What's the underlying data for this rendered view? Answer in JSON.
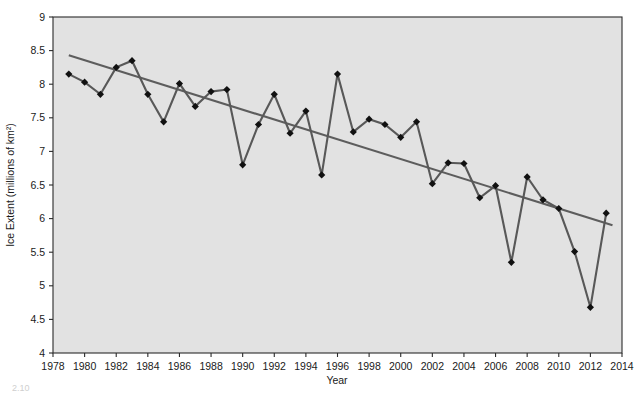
{
  "chart_data": {
    "type": "line",
    "title": "",
    "xlabel": "Year",
    "ylabel": "Ice Extent (millions of km2)",
    "ylabel_display": "Ice Extent (millions of km²)",
    "xlim": [
      1978,
      2014
    ],
    "ylim": [
      4,
      9
    ],
    "xticks": [
      1978,
      1980,
      1982,
      1984,
      1986,
      1988,
      1990,
      1992,
      1994,
      1996,
      1998,
      2000,
      2002,
      2004,
      2006,
      2008,
      2010,
      2012,
      2014
    ],
    "yticks": [
      4,
      4.5,
      5,
      5.5,
      6,
      6.5,
      7,
      7.5,
      8,
      8.5,
      9
    ],
    "grid": false,
    "legend": "none",
    "x": [
      1979,
      1980,
      1981,
      1982,
      1983,
      1984,
      1985,
      1986,
      1987,
      1988,
      1989,
      1990,
      1991,
      1992,
      1993,
      1994,
      1995,
      1996,
      1997,
      1998,
      1999,
      2000,
      2001,
      2002,
      2003,
      2004,
      2005,
      2006,
      2007,
      2008,
      2009,
      2010,
      2011,
      2012,
      2013
    ],
    "series": [
      {
        "name": "Arctic sea ice extent",
        "marker": "diamond",
        "color": "#585858",
        "values": [
          8.15,
          8.03,
          7.85,
          8.25,
          8.35,
          7.85,
          7.44,
          8.01,
          7.67,
          7.89,
          7.92,
          6.8,
          7.4,
          7.85,
          7.27,
          7.6,
          6.65,
          8.15,
          7.29,
          7.48,
          7.4,
          7.21,
          7.44,
          6.52,
          6.83,
          6.82,
          6.31,
          6.49,
          5.35,
          6.62,
          6.28,
          6.15,
          5.51,
          4.68,
          6.08
        ]
      }
    ],
    "trendline": {
      "name": "linear trend",
      "color": "#5d5d5d",
      "x_start": 1979,
      "y_start": 8.43,
      "x_end": 2013.4,
      "y_end": 5.9
    }
  },
  "footer": {
    "cut_off_text": "2.10"
  }
}
